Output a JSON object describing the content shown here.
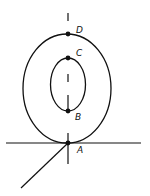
{
  "diagram": {
    "points": [
      {
        "label": "D",
        "x": 68,
        "y": 34,
        "lx": 76,
        "ly": 33
      },
      {
        "label": "C",
        "x": 68,
        "y": 58,
        "lx": 76,
        "ly": 56
      },
      {
        "label": "B",
        "x": 68,
        "y": 111,
        "lx": 75,
        "ly": 120
      },
      {
        "label": "A",
        "x": 68,
        "y": 143,
        "lx": 77,
        "ly": 153
      }
    ],
    "colors": {
      "stroke": "#111111",
      "background": "#ffffff"
    }
  }
}
